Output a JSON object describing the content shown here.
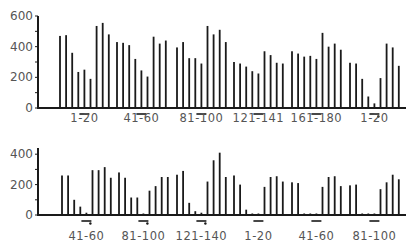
{
  "chart_data": [
    {
      "type": "bar",
      "panel": "top",
      "title": "",
      "xlabel": "",
      "ylabel": "",
      "ylim": [
        0,
        600
      ],
      "yticks": [
        0,
        200,
        400,
        600
      ],
      "ytick_labels": [
        "0",
        "200",
        "400",
        "600"
      ],
      "grid": false,
      "legend": null,
      "groups": [
        {
          "label": "1-20",
          "marker": "bar",
          "values": [
            470,
            475,
            360,
            235,
            250,
            190,
            535,
            555,
            480
          ]
        },
        {
          "label": "41-60",
          "marker": "bar",
          "values": [
            430,
            425,
            410,
            320,
            245,
            205,
            465,
            420,
            440
          ]
        },
        {
          "label": "81-100",
          "marker": "bar",
          "values": [
            395,
            430,
            325,
            325,
            290,
            535,
            480,
            510,
            430
          ]
        },
        {
          "label": "121-141",
          "marker": "bar",
          "values": [
            300,
            290,
            270,
            240,
            225,
            370,
            345,
            295,
            290
          ]
        },
        {
          "label": "161-180",
          "marker": "bar",
          "values": [
            370,
            355,
            335,
            340,
            320,
            490,
            400,
            420,
            380
          ]
        },
        {
          "label": "1-20",
          "marker": "bar-dot",
          "values": [
            295,
            290,
            190,
            75,
            30,
            195,
            420,
            395,
            275
          ]
        }
      ]
    },
    {
      "type": "bar",
      "panel": "bottom",
      "title": "",
      "xlabel": "",
      "ylabel": "",
      "ylim": [
        0,
        400
      ],
      "yticks": [
        0,
        200,
        400
      ],
      "ytick_labels": [
        "0",
        "200",
        "400"
      ],
      "grid": false,
      "legend": null,
      "groups": [
        {
          "label": "41-60",
          "marker": "bar-dot",
          "values": [
            260,
            260,
            100,
            55,
            15,
            295,
            295,
            315,
            245
          ]
        },
        {
          "label": "81-100",
          "marker": "bar-dot",
          "values": [
            280,
            245,
            115,
            115,
            10,
            160,
            190,
            250,
            250
          ]
        },
        {
          "label": "121-140",
          "marker": "bar-dot",
          "values": [
            265,
            290,
            80,
            25,
            15,
            220,
            360,
            410,
            250
          ]
        },
        {
          "label": "1-20",
          "marker": "bar",
          "values": [
            260,
            200,
            35,
            10,
            10,
            185,
            250,
            255,
            220
          ]
        },
        {
          "label": "41-60",
          "marker": "bar",
          "values": [
            215,
            210,
            10,
            10,
            10,
            185,
            250,
            255,
            190
          ]
        },
        {
          "label": "81-100",
          "marker": "bar",
          "values": [
            195,
            200,
            10,
            10,
            10,
            170,
            215,
            265,
            235
          ]
        }
      ]
    }
  ],
  "style": {
    "bar_color": "#1a1a1a",
    "axis_color": "#1a1a1a",
    "text_color": "#555555"
  }
}
